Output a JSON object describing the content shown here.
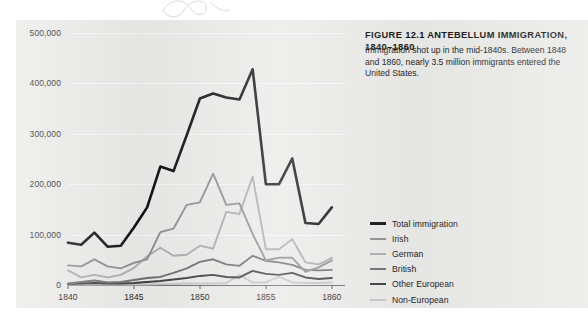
{
  "figure": {
    "title": "FIGURE 12.1   ANTEBELLUM IMMIGRATION, 1840–1860",
    "caption": "Immigration shot up in the mid-1840s. Between 1848 and 1860, nearly 3.5 million immigrants entered the United States."
  },
  "legend": {
    "position": "right",
    "items": [
      {
        "label": "Total immigration",
        "color": "#111111",
        "width": 2.6
      },
      {
        "label": "Irish",
        "color": "#8d8d8d",
        "width": 2.0
      },
      {
        "label": "German",
        "color": "#aaaaaa",
        "width": 2.0
      },
      {
        "label": "British",
        "color": "#6d6d6d",
        "width": 2.0
      },
      {
        "label": "Other European",
        "color": "#3c3c3c",
        "width": 2.0
      },
      {
        "label": "Non-European",
        "color": "#c4c4c4",
        "width": 2.0
      }
    ]
  },
  "chart_data": {
    "type": "line",
    "title": "ANTEBELLUM IMMIGRATION, 1840–1860",
    "xlabel": "",
    "ylabel": "",
    "xlim": [
      1840,
      1861
    ],
    "ylim": [
      0,
      500000
    ],
    "grid": true,
    "x": [
      1840,
      1841,
      1842,
      1843,
      1844,
      1845,
      1846,
      1847,
      1848,
      1849,
      1850,
      1851,
      1852,
      1853,
      1854,
      1855,
      1856,
      1857,
      1858,
      1859,
      1860
    ],
    "xticks": [
      "1840",
      "1845",
      "1850",
      "1855",
      "1860"
    ],
    "yticks": [
      "0",
      "100,000",
      "200,000",
      "300,000",
      "400,000",
      "500,000"
    ],
    "series": [
      {
        "name": "Total immigration",
        "color": "#111111",
        "values": [
          84000,
          80000,
          104000,
          76000,
          78000,
          114000,
          154000,
          235000,
          226000,
          297000,
          370000,
          380000,
          372000,
          368000,
          428000,
          200000,
          200000,
          251000,
          123000,
          121000,
          154000
        ]
      },
      {
        "name": "Irish",
        "color": "#8d8d8d",
        "values": [
          39000,
          37000,
          51000,
          37000,
          33000,
          44000,
          51000,
          105000,
          112000,
          159000,
          164000,
          221000,
          159000,
          162000,
          101000,
          49000,
          54000,
          54000,
          26000,
          35000,
          49000
        ]
      },
      {
        "name": "German",
        "color": "#aaaaaa",
        "values": [
          29000,
          15000,
          20000,
          15000,
          20000,
          34000,
          57000,
          74000,
          58000,
          60000,
          78000,
          72000,
          145000,
          141000,
          215000,
          71000,
          71000,
          91000,
          45000,
          41000,
          54000
        ]
      },
      {
        "name": "British",
        "color": "#6d6d6d",
        "values": [
          3000,
          6000,
          9000,
          5000,
          6000,
          10000,
          14000,
          16000,
          24000,
          33000,
          46000,
          51000,
          41000,
          38000,
          58000,
          48000,
          45000,
          40000,
          30000,
          29000,
          30000
        ]
      },
      {
        "name": "Other European",
        "color": "#3c3c3c",
        "values": [
          2000,
          3000,
          4000,
          3000,
          3000,
          4000,
          6000,
          8000,
          11000,
          14000,
          18000,
          20000,
          16000,
          15000,
          28000,
          22000,
          20000,
          24000,
          15000,
          12000,
          14000
        ]
      },
      {
        "name": "Non-European",
        "color": "#c4c4c4",
        "values": [
          1000,
          1000,
          1000,
          1000,
          1000,
          1000,
          1000,
          2000,
          2000,
          3000,
          3000,
          3000,
          4000,
          20000,
          5000,
          5000,
          16000,
          5000,
          4000,
          4000,
          5000
        ]
      }
    ]
  }
}
